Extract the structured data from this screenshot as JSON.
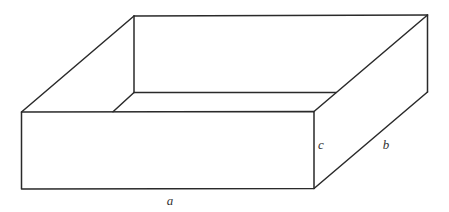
{
  "diagram": {
    "type": "open-box-3d",
    "stroke_color": "#2a2a2a",
    "labels": {
      "a": {
        "text": "a",
        "refers_to": "length (front bottom edge)",
        "x": 170,
        "y": 205
      },
      "b": {
        "text": "b",
        "refers_to": "width (right receding edge)",
        "x": 386,
        "y": 149
      },
      "c": {
        "text": "c",
        "refers_to": "height (front right vertical edge)",
        "x": 321,
        "y": 149
      }
    },
    "vertices": {
      "front_top_left": [
        21.5,
        112
      ],
      "front_top_right": [
        314,
        111.5
      ],
      "front_bottom_left": [
        21.5,
        189
      ],
      "front_bottom_right": [
        314,
        188.5
      ],
      "back_top_left": [
        134,
        16
      ],
      "back_top_right": [
        427.5,
        15
      ],
      "back_bottom_left_inner": [
        134,
        92.5
      ],
      "back_bottom_right": [
        427.5,
        92
      ],
      "inner_back_bottom_right_visible": [
        336,
        92.5
      ],
      "inner_left_bottom_visible": [
        113,
        111.8
      ]
    }
  }
}
